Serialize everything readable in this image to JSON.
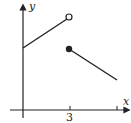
{
  "figure": {
    "type": "piecewise-function-graph",
    "axes": {
      "x_label": "x",
      "y_label": "y",
      "x_ticks": [
        {
          "value": 3,
          "label": "3"
        },
        {
          "value": null,
          "label": ""
        }
      ]
    },
    "segments": [
      {
        "name": "left-piece",
        "slope": "positive",
        "start": "y-intercept (closed, on axis)",
        "end_x": 3,
        "end_marker": "open-circle"
      },
      {
        "name": "right-piece",
        "slope": "negative",
        "start_x": 3,
        "start_marker": "filled-circle",
        "end": "continues right"
      }
    ],
    "colors": {
      "stroke": "#222222",
      "background": "#ffffff"
    }
  }
}
